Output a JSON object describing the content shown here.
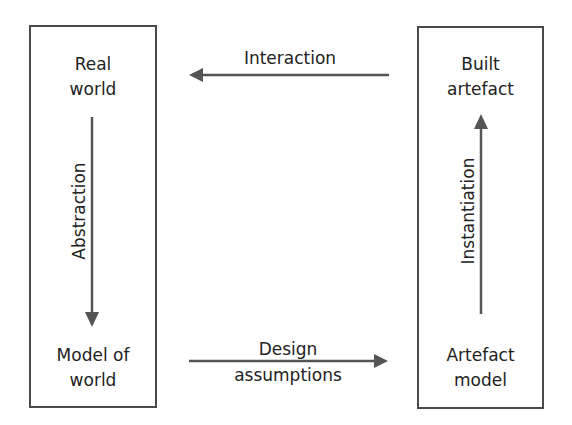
{
  "diagram": {
    "nodes": {
      "real_world": {
        "line1": "Real",
        "line2": "world"
      },
      "model_of_world": {
        "line1": "Model of",
        "line2": "world"
      },
      "built_artefact": {
        "line1": "Built",
        "line2": "artefact"
      },
      "artefact_model": {
        "line1": "Artefact",
        "line2": "model"
      }
    },
    "edges": {
      "interaction": {
        "label": "Interaction",
        "from": "Built artefact",
        "to": "Real world"
      },
      "abstraction": {
        "label": "Abstraction",
        "from": "Real world",
        "to": "Model of world"
      },
      "design_assumptions": {
        "line1": "Design",
        "line2": "assumptions",
        "from": "Model of world",
        "to": "Artefact model"
      },
      "instantiation": {
        "label": "Instantiation",
        "from": "Artefact model",
        "to": "Built artefact"
      }
    },
    "colors": {
      "stroke": "#4a4a4a",
      "arrow": "#555555",
      "text": "#222222"
    }
  }
}
